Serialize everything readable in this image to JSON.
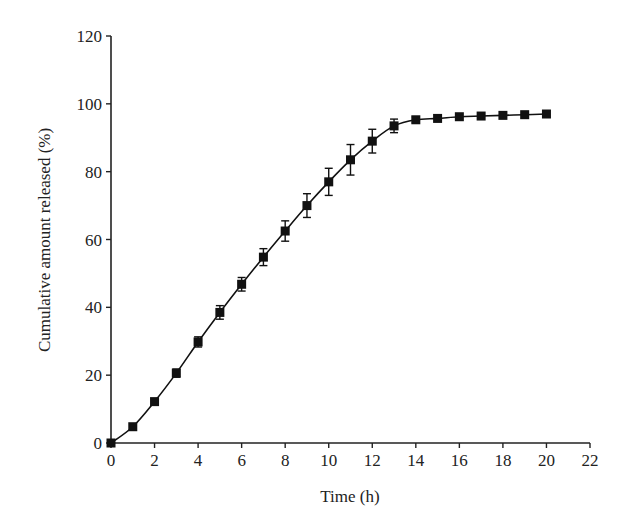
{
  "chart_data": {
    "type": "line",
    "title": "",
    "xlabel": "Time (h)",
    "ylabel": "Cumulative amount released (%)",
    "xlim": [
      0,
      22
    ],
    "ylim": [
      0,
      120
    ],
    "x_ticks": [
      0,
      2,
      4,
      6,
      8,
      10,
      12,
      14,
      16,
      18,
      20,
      22
    ],
    "y_ticks": [
      0,
      20,
      40,
      60,
      80,
      100,
      120
    ],
    "grid": false,
    "legend": null,
    "marker": "square",
    "color": "#111111",
    "series": [
      {
        "name": "Cumulative release",
        "x": [
          0,
          1,
          2,
          3,
          4,
          5,
          6,
          7,
          8,
          9,
          10,
          11,
          12,
          13,
          14,
          15,
          16,
          17,
          18,
          19,
          20
        ],
        "values": [
          0,
          4.8,
          12.2,
          20.6,
          29.8,
          38.5,
          46.8,
          54.8,
          62.5,
          70.0,
          77.0,
          83.5,
          89.0,
          93.5,
          95.3,
          95.7,
          96.2,
          96.4,
          96.6,
          96.8,
          97.0
        ],
        "error": [
          0,
          0.5,
          0.6,
          1.2,
          1.5,
          2.0,
          2.0,
          2.5,
          3.0,
          3.5,
          4.0,
          4.5,
          3.5,
          2.0,
          0.8,
          0.6,
          0.6,
          0.5,
          0.5,
          0.5,
          0.5
        ]
      }
    ]
  }
}
